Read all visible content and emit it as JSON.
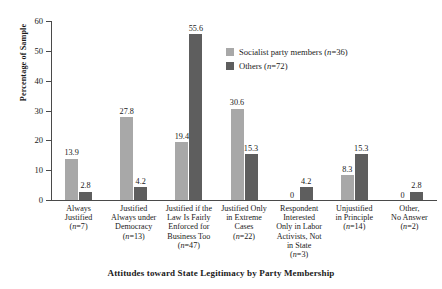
{
  "chart_data": {
    "type": "bar",
    "title": "",
    "xlabel": "Attitudes toward State Legitimacy by Party Membership",
    "ylabel": "Percentage of Sample",
    "ylim": [
      0,
      60
    ],
    "yticks": [
      0,
      10,
      20,
      30,
      40,
      50,
      60
    ],
    "grid": false,
    "legend_position": "upper-center-right",
    "categories": [
      "Always Justified (n=7)",
      "Justified Always under Democracy (n=13)",
      "Justified if the Law Is Fairly Enforced for Business Too (n=47)",
      "Justified Only in Extreme Cases (n=22)",
      "Respondent Interested Only in Labor Activists, Not in State (n=3)",
      "Unjustified in Principle (n=14)",
      "Other, No Answer (n=2)"
    ],
    "category_lines": [
      [
        "Always",
        "Justified",
        "(n=7)"
      ],
      [
        "Justified",
        "Always under",
        "Democracy",
        "(n=13)"
      ],
      [
        "Justified if the",
        "Law Is Fairly",
        "Enforced for",
        "Business Too",
        "(n=47)"
      ],
      [
        "Justified Only",
        "in Extreme",
        "Cases",
        "(n=22)"
      ],
      [
        "Respondent",
        "Interested",
        "Only in Labor",
        "Activists, Not",
        "in State",
        "(n=3)"
      ],
      [
        "Unjustified",
        "in Principle",
        "(n=14)"
      ],
      [
        "Other,",
        "No Answer",
        "(n=2)"
      ]
    ],
    "series": [
      {
        "name": "Socialist party members (n=36)",
        "color": "#a8a8a8",
        "values": [
          13.9,
          27.8,
          19.4,
          30.6,
          0,
          8.3,
          0
        ],
        "labels": [
          "13.9",
          "27.8",
          "19.4",
          "30.6",
          "0",
          "8.3",
          "0"
        ]
      },
      {
        "name": "Others (n=72)",
        "color": "#5e5e5e",
        "values": [
          2.8,
          4.2,
          55.6,
          15.3,
          4.2,
          15.3,
          2.8
        ],
        "labels": [
          "2.8",
          "4.2",
          "55.6",
          "15.3",
          "4.2",
          "15.3",
          "2.8"
        ]
      }
    ],
    "ytick_labels": [
      "0",
      "10",
      "20",
      "30",
      "40",
      "50",
      "60"
    ]
  }
}
